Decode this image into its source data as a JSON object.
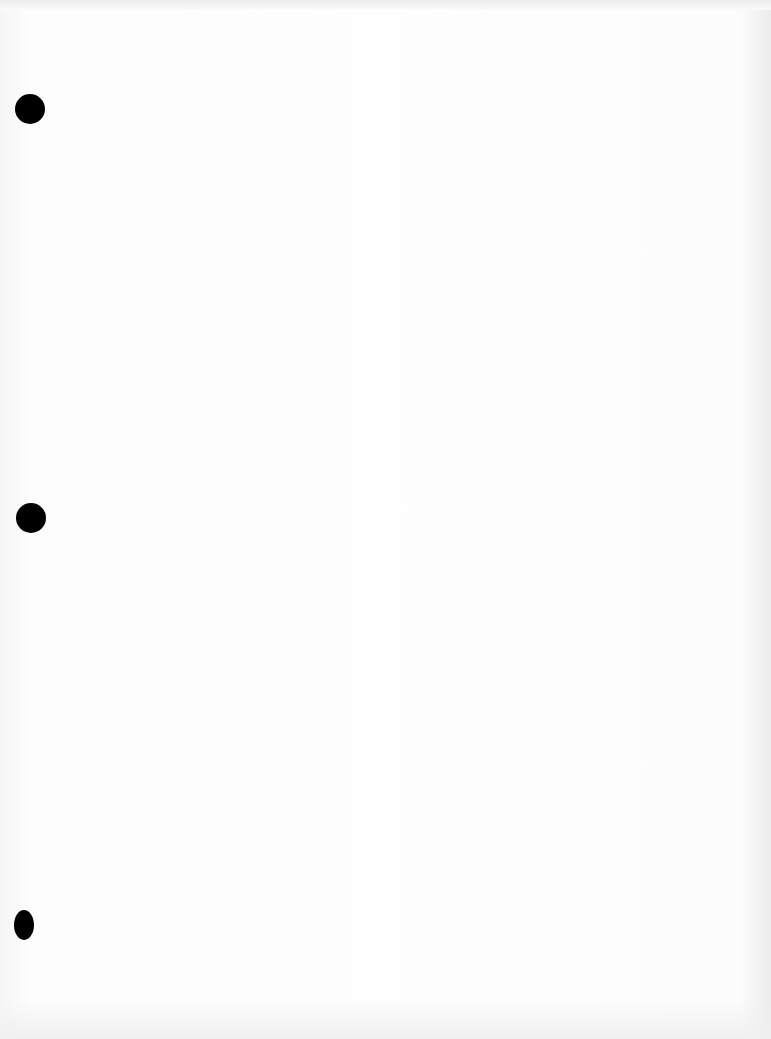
{
  "document": {
    "type": "blank scanned page",
    "text": "",
    "punch_holes": [
      {
        "id": "top",
        "x": 30,
        "y": 109
      },
      {
        "id": "middle",
        "x": 31,
        "y": 518
      },
      {
        "id": "bottom",
        "x": 24,
        "y": 925
      }
    ],
    "colors": {
      "paper": "#fbfbfb",
      "hole": "#000000"
    }
  }
}
